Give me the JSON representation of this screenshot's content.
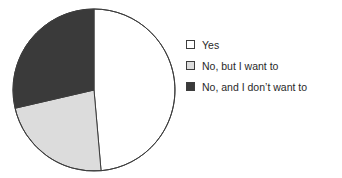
{
  "chart_data": {
    "type": "pie",
    "title": "",
    "xlabel": "",
    "ylabel": "",
    "grid": false,
    "legend_position": "right",
    "start_angle_deg": 0,
    "direction": "clockwise",
    "categories": [
      "Yes",
      "No, but I want to",
      "No, and I don’t want to"
    ],
    "values": [
      48.6,
      22.8,
      28.6
    ],
    "value_unit": "percent",
    "slice_colors": [
      "#ffffff",
      "#dcdcdc",
      "#3a3a3a"
    ],
    "slice_angles_deg": [
      175,
      82,
      103
    ],
    "slices": [
      {
        "label": "Yes",
        "value": 48.6,
        "color": "#ffffff",
        "start_deg": 0,
        "end_deg": 175,
        "sweep_deg": 175
      },
      {
        "label": "No, but I want to",
        "value": 22.8,
        "color": "#dcdcdc",
        "start_deg": 175,
        "end_deg": 257,
        "sweep_deg": 82
      },
      {
        "label": "No, and I don’t want to",
        "value": 28.6,
        "color": "#3a3a3a",
        "start_deg": 257,
        "end_deg": 360,
        "sweep_deg": 103
      }
    ]
  },
  "legend": {
    "items": [
      {
        "label": "Yes",
        "color": "#ffffff"
      },
      {
        "label": "No, but I want to",
        "color": "#dcdcdc"
      },
      {
        "label": "No, and I don’t want to",
        "color": "#3a3a3a"
      }
    ]
  },
  "style": {
    "background": "#ffffff",
    "outline_color": "#3d3d3d",
    "text_color": "#292929"
  }
}
